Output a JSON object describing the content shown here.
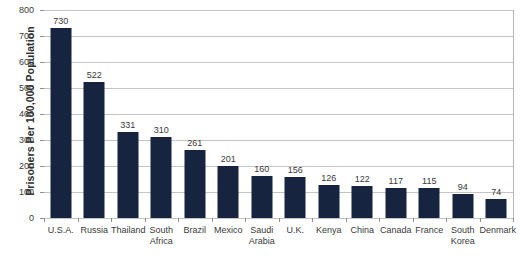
{
  "chart_data": {
    "type": "bar",
    "title": "",
    "xlabel": "",
    "ylabel": "Prisoners Per 100,000 Population",
    "ylim": [
      0,
      800
    ],
    "ytick_step": 100,
    "yticks": [
      0,
      100,
      200,
      300,
      400,
      500,
      600,
      700,
      800
    ],
    "grid": true,
    "legend": "none",
    "bar_color": "#16243f",
    "gridline_color": "#c4c4c4",
    "axis_color": "#8e8e8e",
    "background_color": "#ffffff",
    "categories": [
      "U.S.A.",
      "Russia",
      "Thailand",
      "South Africa",
      "Brazil",
      "Mexico",
      "Saudi Arabia",
      "U.K.",
      "Kenya",
      "China",
      "Canada",
      "France",
      "South Korea",
      "Denmark"
    ],
    "values": [
      730,
      522,
      331,
      310,
      261,
      201,
      160,
      156,
      126,
      122,
      117,
      115,
      94,
      74
    ],
    "data_labels": [
      "730",
      "522",
      "331",
      "310",
      "261",
      "201",
      "160",
      "156",
      "126",
      "122",
      "117",
      "115",
      "94",
      "74"
    ]
  }
}
